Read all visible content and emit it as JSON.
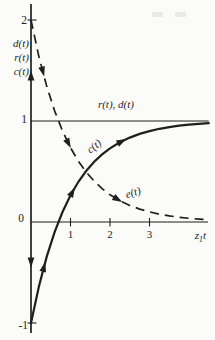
{
  "figure": {
    "ink_color": "#1f1f1f",
    "background_color": "#fbfbf9"
  },
  "chart_data": {
    "type": "line",
    "title": "",
    "xlabel": {
      "var": "z",
      "sub": "1",
      "mult": "t"
    },
    "ylabel_lines": [
      "d(t)",
      "r(t)",
      "c(t)"
    ],
    "xlim": [
      0,
      4.5
    ],
    "ylim": [
      -1.1,
      2.16
    ],
    "grid": false,
    "x_ticks": [
      1,
      2,
      3
    ],
    "y_tick_marks": [
      2,
      -1
    ],
    "y_tick_labels": [
      {
        "text": "2",
        "v": 2,
        "dx": 0,
        "dy": 0
      },
      {
        "text": "1",
        "v": 1,
        "dx": 0,
        "dy": -2
      },
      {
        "text": "0",
        "v": 0,
        "dx": -3,
        "dy": -4
      },
      {
        "text": "-1",
        "v": -1,
        "dx": 1,
        "dy": 2
      }
    ],
    "series": [
      {
        "name": "r(t), d(t)",
        "style": "thin",
        "dashed": false,
        "points": [
          [
            0,
            1
          ],
          [
            4.5,
            1
          ]
        ]
      },
      {
        "name": "c(t)",
        "style": "solid",
        "dashed": false,
        "points": [
          [
            0,
            -1
          ],
          [
            0.2,
            -0.6375
          ],
          [
            0.4,
            -0.3406
          ],
          [
            0.6,
            -0.0976
          ],
          [
            0.8,
            0.1013
          ],
          [
            1.0,
            0.2642
          ],
          [
            1.2,
            0.3976
          ],
          [
            1.4,
            0.5068
          ],
          [
            1.6,
            0.5962
          ],
          [
            1.8,
            0.6694
          ],
          [
            2.0,
            0.7293
          ],
          [
            2.25,
            0.7892
          ],
          [
            2.5,
            0.8358
          ],
          [
            2.75,
            0.8722
          ],
          [
            3.0,
            0.9004
          ],
          [
            3.25,
            0.9224
          ],
          [
            3.5,
            0.9396
          ],
          [
            3.75,
            0.953
          ],
          [
            4.0,
            0.9634
          ],
          [
            4.25,
            0.9715
          ],
          [
            4.5,
            0.9778
          ]
        ]
      },
      {
        "name": "e(t)",
        "style": "dashed",
        "dashed": true,
        "points": [
          [
            0,
            2
          ],
          [
            0.2,
            1.6375
          ],
          [
            0.4,
            1.3406
          ],
          [
            0.6,
            1.0976
          ],
          [
            0.8,
            0.8987
          ],
          [
            1.0,
            0.7358
          ],
          [
            1.2,
            0.6024
          ],
          [
            1.4,
            0.4932
          ],
          [
            1.6,
            0.4038
          ],
          [
            1.8,
            0.3306
          ],
          [
            2.0,
            0.2707
          ],
          [
            2.25,
            0.2108
          ],
          [
            2.5,
            0.1642
          ],
          [
            2.75,
            0.1278
          ],
          [
            3.0,
            0.0996
          ],
          [
            3.25,
            0.0776
          ],
          [
            3.5,
            0.0604
          ],
          [
            3.75,
            0.047
          ],
          [
            4.0,
            0.0366
          ],
          [
            4.25,
            0.0285
          ],
          [
            4.5,
            0.0222
          ]
        ]
      }
    ],
    "curve_labels": [
      {
        "text": "r(t), d(t)",
        "series": "rd",
        "t": 2.15,
        "v": 1.13,
        "rotation": 0
      },
      {
        "text": "c(t)",
        "series": "c",
        "t": 1.65,
        "v": 0.723,
        "rotation": -38
      },
      {
        "text": "e(t)",
        "series": "e",
        "t": 2.61,
        "v": 0.257,
        "rotation": -17
      }
    ],
    "curve_arrows": [
      {
        "on": "c",
        "t": 0.33,
        "angle_deg": -75
      },
      {
        "on": "c",
        "t": 1.05,
        "angle_deg": -61
      },
      {
        "on": "c",
        "t": 2.3,
        "angle_deg": -27
      },
      {
        "on": "e",
        "t": 0.3,
        "angle_deg": 75
      },
      {
        "on": "e",
        "t": 0.95,
        "angle_deg": 63
      },
      {
        "on": "e",
        "t": 2.2,
        "angle_deg": 30
      }
    ],
    "axis_arrows": [
      {
        "v": 1.45,
        "dir": "up"
      },
      {
        "v": -0.4,
        "dir": "down"
      }
    ],
    "layout": {
      "x0": 31,
      "y0": 222,
      "sx": 39.5,
      "sy": 101,
      "axis_top_px": 4,
      "axis_bottom_px": 333,
      "x_axis_end_px": 208,
      "widths": {
        "thin": 1.1,
        "solid": 2.2,
        "dashed": 1.7
      },
      "dash_pattern": "9 6"
    }
  }
}
